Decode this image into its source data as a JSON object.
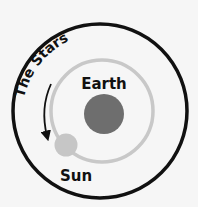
{
  "diagram": {
    "title_arc_text": "The Stars",
    "earth_label": "Earth",
    "sun_label": "Sun",
    "colors": {
      "background": "#f6f6f6",
      "outer_circle": "#111111",
      "orbit": "#c8c8c8",
      "earth": "#6e6e6e",
      "sun": "#c6c6c6",
      "arrow": "#111111"
    }
  }
}
